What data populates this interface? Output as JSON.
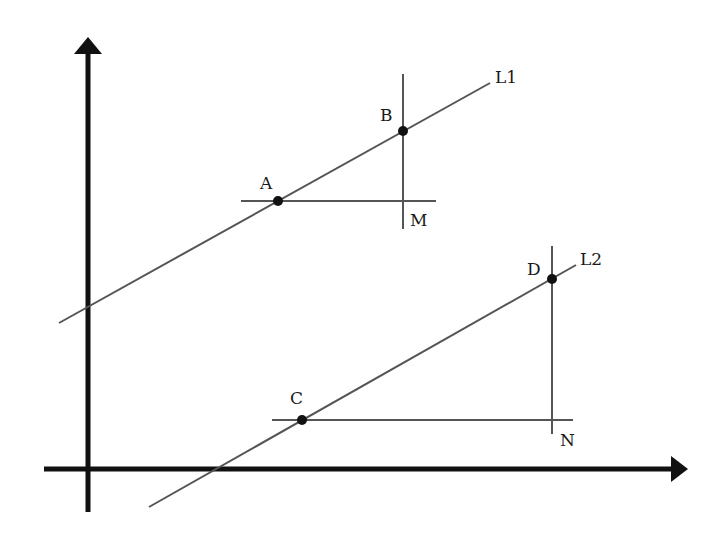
{
  "diagram": {
    "type": "coordinate-geometry",
    "axes": {
      "x_axis": {
        "from": [
          44,
          469
        ],
        "to": [
          688,
          469
        ],
        "arrow": "right"
      },
      "y_axis": {
        "from": [
          88,
          512
        ],
        "to": [
          88,
          37
        ],
        "arrow": "up"
      }
    },
    "lines": [
      {
        "id": "L1",
        "label": "L1",
        "from": [
          59,
          323
        ],
        "to": [
          490,
          83
        ],
        "label_pos": [
          495,
          83
        ]
      },
      {
        "id": "L2",
        "label": "L2",
        "from": [
          149,
          507
        ],
        "to": [
          576,
          265
        ],
        "label_pos": [
          580,
          265
        ]
      }
    ],
    "construction_lines": [
      {
        "id": "AM",
        "orientation": "horizontal",
        "from": [
          241,
          201
        ],
        "to": [
          436,
          201
        ]
      },
      {
        "id": "BM",
        "orientation": "vertical",
        "from": [
          403,
          74
        ],
        "to": [
          403,
          229
        ]
      },
      {
        "id": "CN",
        "orientation": "horizontal",
        "from": [
          272,
          420
        ],
        "to": [
          573,
          420
        ]
      },
      {
        "id": "DN",
        "orientation": "vertical",
        "from": [
          552,
          246
        ],
        "to": [
          552,
          434
        ]
      }
    ],
    "points": [
      {
        "id": "A",
        "label": "A",
        "pos": [
          278,
          201
        ],
        "label_pos": [
          260,
          189
        ],
        "dot": true
      },
      {
        "id": "B",
        "label": "B",
        "pos": [
          403,
          131
        ],
        "label_pos": [
          380,
          121
        ],
        "dot": true
      },
      {
        "id": "M",
        "label": "M",
        "pos": [
          403,
          201
        ],
        "label_pos": [
          410,
          226
        ],
        "dot": false
      },
      {
        "id": "C",
        "label": "C",
        "pos": [
          302,
          420
        ],
        "label_pos": [
          290,
          404
        ],
        "dot": true
      },
      {
        "id": "D",
        "label": "D",
        "pos": [
          552,
          279
        ],
        "label_pos": [
          527,
          275
        ],
        "dot": true
      },
      {
        "id": "N",
        "label": "N",
        "pos": [
          552,
          420
        ],
        "label_pos": [
          560,
          446
        ],
        "dot": false
      }
    ]
  }
}
